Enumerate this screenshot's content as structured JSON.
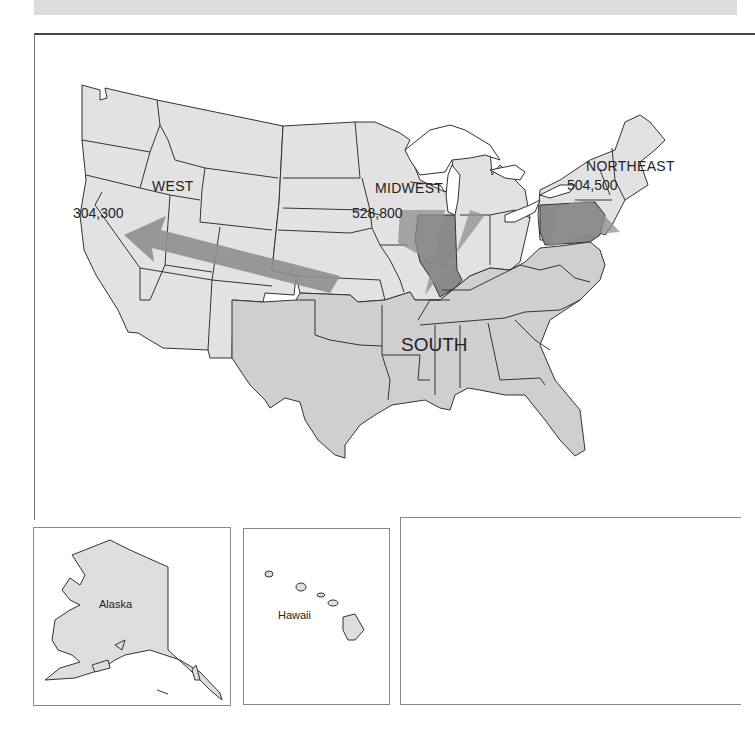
{
  "map": {
    "regions": [
      {
        "name": "WEST",
        "value": "304,300"
      },
      {
        "name": "MIDWEST",
        "value": "528,800"
      },
      {
        "name": "NORTHEAST",
        "value": "504,500"
      },
      {
        "name": "SOUTH"
      }
    ],
    "insets": [
      {
        "label": "Alaska"
      },
      {
        "label": "Hawaii"
      }
    ],
    "colors": {
      "state_fill": "#dedede",
      "south_fill": "#cdcdcd",
      "highlight_fill": "#8a8a8a",
      "arrow_fill": "#8f8f8f",
      "border": "#333333"
    }
  }
}
